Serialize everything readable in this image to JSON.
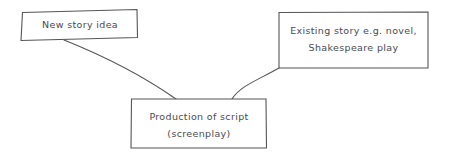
{
  "diagram": {
    "style": {
      "background": "#ffffff",
      "stroke_color": "#55555a",
      "text_color": "#4a4a4f"
    },
    "nodes": [
      {
        "id": "new-story-idea",
        "lines": [
          "New story idea"
        ]
      },
      {
        "id": "existing-story",
        "lines": [
          "Existing story e.g. novel,",
          "Shakespeare play"
        ]
      },
      {
        "id": "production-of-script",
        "lines": [
          "Production of script",
          "(screenplay)"
        ]
      }
    ],
    "connectors": [
      {
        "id": "new-story-idea-to-production",
        "from": "new-story-idea",
        "to": "production-of-script"
      },
      {
        "id": "existing-story-to-production",
        "from": "existing-story",
        "to": "production-of-script"
      }
    ]
  }
}
